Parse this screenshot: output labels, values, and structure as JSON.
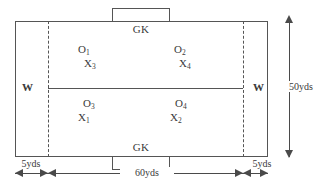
{
  "diagram": {
    "field": {
      "goalkeeper_top_label": "GK",
      "goalkeeper_bottom_label": "GK",
      "winger_left_label": "W",
      "winger_right_label": "W"
    },
    "players": [
      {
        "name": "o1",
        "base": "O",
        "sub": "1"
      },
      {
        "name": "x3",
        "base": "X",
        "sub": "3"
      },
      {
        "name": "o2",
        "base": "O",
        "sub": "2"
      },
      {
        "name": "x4",
        "base": "X",
        "sub": "4"
      },
      {
        "name": "o3",
        "base": "O",
        "sub": "3"
      },
      {
        "name": "x1",
        "base": "X",
        "sub": "1"
      },
      {
        "name": "o4",
        "base": "O",
        "sub": "4"
      },
      {
        "name": "x2",
        "base": "X",
        "sub": "2"
      }
    ],
    "dimensions": {
      "height_label": "50yds",
      "left_channel_label": "5yds",
      "middle_label": "60yds",
      "right_channel_label": "5yds"
    },
    "colors": {
      "line": "#555555",
      "dimension": "#4a4a4a",
      "text": "#3a3a3a",
      "background": "#ffffff"
    }
  }
}
